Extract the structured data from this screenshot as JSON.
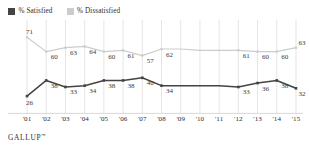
{
  "legend": {
    "items": [
      {
        "label": "% Satisfied",
        "color": "#444444",
        "icon": "legend-swatch-icon"
      },
      {
        "label": "% Dissatisfied",
        "color": "#cccccc",
        "icon": "legend-swatch-icon"
      }
    ]
  },
  "footer": {
    "brand": "GALLUP",
    "mark": "™"
  },
  "chart_data": {
    "type": "line",
    "title": "",
    "xlabel": "",
    "ylabel": "",
    "ylim": [
      20,
      75
    ],
    "grid": "vertical",
    "legend_position": "top-left",
    "categories": [
      "'01",
      "'02",
      "'03",
      "'04",
      "'05",
      "'06",
      "'07",
      "'08",
      "'09",
      "'10",
      "'11",
      "'12",
      "'13",
      "'14",
      "'15"
    ],
    "series": [
      {
        "name": "% Dissatisfied",
        "color": "#cccccc",
        "values": [
          71,
          60,
          63,
          64,
          60,
          61,
          57,
          62,
          62,
          61,
          61,
          61,
          60,
          60,
          63
        ],
        "labels": [
          "71",
          "60",
          "63",
          "64",
          "60",
          "61",
          "57",
          "62",
          "",
          "",
          "",
          "61",
          "60",
          "60",
          "63"
        ]
      },
      {
        "name": "% Satisfied",
        "color": "#444444",
        "values": [
          26,
          38,
          33,
          34,
          38,
          38,
          40,
          34,
          34,
          34,
          34,
          33,
          36,
          38,
          32
        ],
        "labels": [
          "26",
          "38",
          "33",
          "34",
          "38",
          "38",
          "40",
          "34",
          "",
          "",
          "",
          "33",
          "36",
          "38",
          "32"
        ]
      }
    ]
  }
}
